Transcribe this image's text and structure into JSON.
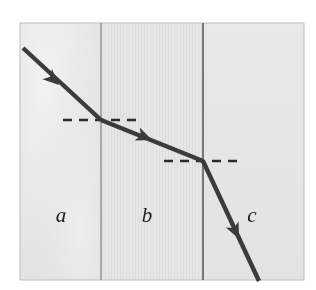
{
  "figure": {
    "caption": "",
    "panel": {
      "x": 20,
      "y": 23,
      "width": 284,
      "height": 257,
      "border_color": "#b9b9b9"
    },
    "regions": [
      {
        "id": "region-a",
        "label": "a",
        "label_x": 61,
        "label_y": 222,
        "x": 20,
        "width": 81,
        "fill": "#e9e9e9",
        "texture": "mottled"
      },
      {
        "id": "region-b",
        "label": "b",
        "label_x": 147,
        "label_y": 222,
        "x": 101,
        "width": 102,
        "fill": "#e4e4e4",
        "texture": "vertical-lines"
      },
      {
        "id": "region-c",
        "label": "c",
        "label_x": 252,
        "label_y": 222,
        "x": 203,
        "width": 101,
        "fill": "#e6e6e6",
        "texture": "plain"
      }
    ],
    "boundaries": [
      {
        "id": "boundary-ab",
        "x": 101,
        "y1": 23,
        "y2": 280,
        "color": "#8a8a8a"
      },
      {
        "id": "boundary-bc",
        "x": 203,
        "y1": 23,
        "y2": 280,
        "color": "#555555"
      }
    ],
    "ray": {
      "color": "#3b3b3b",
      "width": 4.4,
      "segments": [
        {
          "id": "ray-incident-a",
          "x1": 23,
          "y1": 48,
          "x2": 101,
          "y2": 120
        },
        {
          "id": "ray-refracted-b",
          "x1": 101,
          "y1": 120,
          "x2": 203,
          "y2": 161
        },
        {
          "id": "ray-refracted-c",
          "x1": 203,
          "y1": 161,
          "x2": 259,
          "y2": 281
        }
      ],
      "arrowheads": [
        {
          "id": "arrowhead-a",
          "x": 59,
          "y": 85,
          "angle": 42.7
        },
        {
          "id": "arrowhead-b",
          "x": 152,
          "y": 140,
          "angle": 21.9
        },
        {
          "id": "arrowhead-c",
          "x": 239,
          "y": 239,
          "angle": 65.0
        }
      ]
    },
    "normals": [
      {
        "id": "normal-line-ab",
        "x1": 63,
        "x2": 139,
        "y": 120,
        "color": "#2b2b2b",
        "dash": "9 7",
        "width": 2.4
      },
      {
        "id": "normal-line-bc",
        "x1": 164,
        "x2": 239,
        "y": 161,
        "color": "#2b2b2b",
        "dash": "9 7",
        "width": 2.4
      }
    ]
  }
}
